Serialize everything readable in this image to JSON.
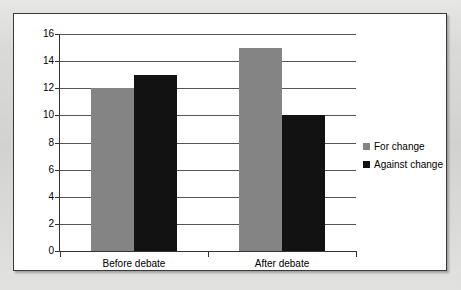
{
  "chart_data": {
    "type": "bar",
    "title": "",
    "xlabel": "",
    "ylabel": "",
    "categories": [
      "Before debate",
      "After debate"
    ],
    "series": [
      {
        "name": "For change",
        "values": [
          12,
          15
        ],
        "color": "#848484"
      },
      {
        "name": "Against change",
        "values": [
          13,
          10
        ],
        "color": "#121212"
      }
    ],
    "ylim": [
      0,
      16
    ],
    "ytick_values": [
      0,
      2,
      4,
      6,
      8,
      10,
      12,
      14,
      16
    ],
    "ytick_labels": [
      "0",
      "2",
      "4",
      "6",
      "8",
      "10",
      "12",
      "14",
      "16"
    ],
    "grid": true,
    "legend_position": "right"
  },
  "axes": {
    "y_ticks": [
      {
        "label": "16",
        "value": 16
      },
      {
        "label": "14",
        "value": 14
      },
      {
        "label": "12",
        "value": 12
      },
      {
        "label": "10",
        "value": 10
      },
      {
        "label": "8",
        "value": 8
      },
      {
        "label": "6",
        "value": 6
      },
      {
        "label": "4",
        "value": 4
      },
      {
        "label": "2",
        "value": 2
      },
      {
        "label": "0",
        "value": 0
      }
    ],
    "x_categories": [
      {
        "label": "Before debate"
      },
      {
        "label": "After debate"
      }
    ]
  },
  "legend": {
    "entries": [
      {
        "label": "For change",
        "swatch": "gray-swatch-icon"
      },
      {
        "label": "Against change",
        "swatch": "black-swatch-icon"
      }
    ]
  },
  "colors": {
    "series_for_change": "#848484",
    "series_against_change": "#121212",
    "page_background": "#d9d9d7",
    "plot_background": "#ffffff",
    "gridline": "#555555",
    "axis": "#333333"
  }
}
